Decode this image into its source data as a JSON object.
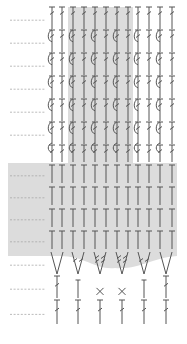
{
  "diagram": {
    "type": "crochet-chart",
    "columns": 12,
    "column_x": [
      52,
      62,
      73,
      84,
      95,
      106,
      117,
      128,
      138,
      149,
      160,
      172
    ],
    "colors": {
      "stitch": "#555555",
      "shade": "#dcdcdc",
      "row_marker": "#aaaaaa"
    },
    "shaded_regions": [
      {
        "name": "center-column-band",
        "x": 68,
        "y": 7,
        "w": 65,
        "h": 156
      },
      {
        "name": "lower-block",
        "shape": "curved-bottom",
        "x": 8,
        "y": 163,
        "w": 169,
        "h": 105
      }
    ],
    "rows": [
      {
        "y": 7,
        "h": 22,
        "stitch": "tr-hook",
        "marker": true
      },
      {
        "y": 30,
        "h": 22,
        "stitch": "tr-post",
        "marker": true
      },
      {
        "y": 53,
        "h": 22,
        "stitch": "tr-post",
        "marker": true
      },
      {
        "y": 76,
        "h": 22,
        "stitch": "tr-post",
        "marker": true
      },
      {
        "y": 99,
        "h": 22,
        "stitch": "tr-post",
        "marker": true
      },
      {
        "y": 122,
        "h": 22,
        "stitch": "tr-post",
        "marker": true
      },
      {
        "y": 145,
        "h": 17,
        "stitch": "tr-post-short",
        "marker": false
      },
      {
        "y": 165,
        "h": 18,
        "stitch": "dc",
        "marker": true
      },
      {
        "y": 187,
        "h": 18,
        "stitch": "dc",
        "marker": true
      },
      {
        "y": 209,
        "h": 18,
        "stitch": "dc",
        "marker": true
      },
      {
        "y": 231,
        "h": 18,
        "stitch": "dc",
        "marker": true
      },
      {
        "y": 252,
        "h": 22,
        "stitch": "v-increase",
        "marker": true
      },
      {
        "y": 276,
        "h": 22,
        "stitch": "mixed",
        "marker": true
      },
      {
        "y": 300,
        "h": 24,
        "stitch": "tr",
        "marker": true
      }
    ],
    "v_row": {
      "x": [
        57,
        78,
        100,
        122,
        144,
        166
      ],
      "stitch_marks": [
        "plain",
        "dtr",
        "tr2",
        "tr2",
        "dtr",
        "plain"
      ]
    },
    "mixed_row": {
      "x": [
        57,
        78,
        100,
        122,
        144,
        166
      ],
      "stitches": [
        "tr",
        "hdc",
        "sc",
        "sc",
        "hdc",
        "tr"
      ]
    },
    "bottom_row": {
      "x": [
        57,
        78,
        100,
        122,
        144,
        166
      ],
      "stitches": [
        "tr",
        "tr",
        "tr",
        "tr",
        "tr",
        "tr"
      ]
    },
    "row_marker": {
      "x1": 10,
      "x2": 46
    }
  }
}
